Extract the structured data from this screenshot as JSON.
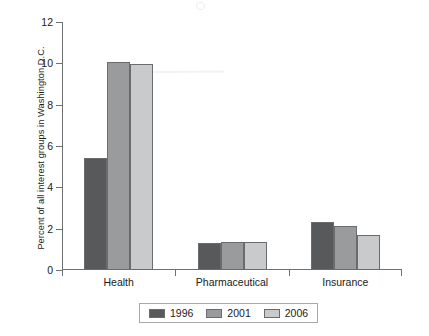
{
  "chart_data": {
    "type": "bar",
    "title": "",
    "subtitle": "",
    "xlabel": "",
    "ylabel": "Percent of all interest groups in Washington D.C.",
    "ylim": [
      0,
      12
    ],
    "yticks": [
      0,
      2,
      4,
      6,
      8,
      10,
      12
    ],
    "grid": false,
    "legend_position": "bottom",
    "categories": [
      "Health",
      "Pharmaceutical",
      "Insurance"
    ],
    "series": [
      {
        "name": "1996",
        "color": "#58595b",
        "values": [
          5.4,
          1.3,
          2.3
        ]
      },
      {
        "name": "2001",
        "color": "#9a9b9d",
        "values": [
          10.05,
          1.35,
          2.15
        ]
      },
      {
        "name": "2006",
        "color": "#c9cacb",
        "values": [
          9.95,
          1.35,
          1.7
        ]
      }
    ]
  },
  "axis": {
    "tick_labels": [
      "0",
      "2",
      "4",
      "6",
      "8",
      "10",
      "12"
    ]
  },
  "legend": {
    "entries": [
      {
        "label": "1996",
        "color": "#58595b"
      },
      {
        "label": "2001",
        "color": "#9a9b9d"
      },
      {
        "label": "2006",
        "color": "#c9cacb"
      }
    ]
  },
  "categories": [
    "Health",
    "Pharmaceutical",
    "Insurance"
  ]
}
